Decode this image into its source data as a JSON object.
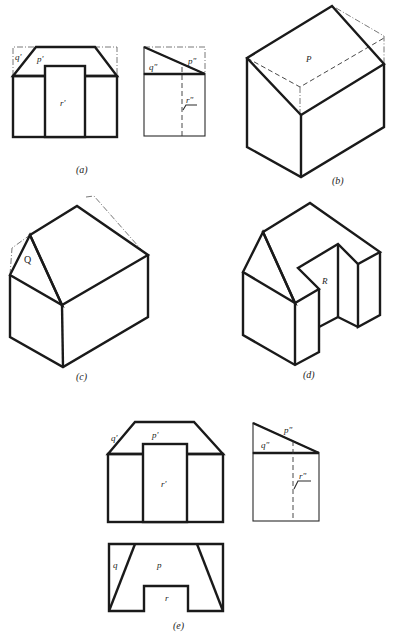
{
  "figures": {
    "a": {
      "caption": "(a)",
      "front_view": {
        "labels": {
          "q": "q'",
          "p": "p'",
          "r": "r'"
        }
      },
      "side_view": {
        "labels": {
          "q": "q\"",
          "p": "p\"",
          "r": "r\""
        }
      }
    },
    "b": {
      "caption": "(b)",
      "labels": {
        "p": "P"
      }
    },
    "c": {
      "caption": "(c)",
      "labels": {
        "q": "Q"
      }
    },
    "d": {
      "caption": "(d)",
      "labels": {
        "r": "R"
      }
    },
    "e": {
      "caption": "(e)",
      "front_view": {
        "labels": {
          "q": "q'",
          "p": "p'",
          "r": "r'"
        }
      },
      "side_view": {
        "labels": {
          "q": "q\"",
          "p": "p\"",
          "r": "r\""
        }
      },
      "top_view": {
        "labels": {
          "q": "q",
          "p": "p",
          "r": "r"
        }
      }
    }
  },
  "colors": {
    "line": "#1a1a1a",
    "background": "#ffffff"
  }
}
